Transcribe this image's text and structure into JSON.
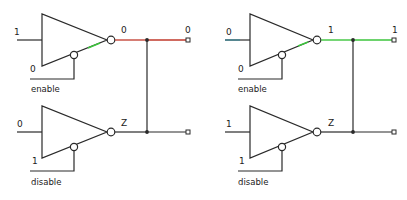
{
  "diagram": {
    "colors": {
      "logic_low": "#c0392b",
      "logic_high": "#3cc43c",
      "wire": "#2a2a2a",
      "background": "#ffffff"
    },
    "circuits": [
      {
        "name": "left",
        "top_gate": {
          "input": "1",
          "control_value": "0",
          "control_label": "enable",
          "output": "0"
        },
        "bottom_gate": {
          "input": "0",
          "control_value": "1",
          "control_label": "disable",
          "output": "Z"
        },
        "bus_output": "0"
      },
      {
        "name": "right",
        "top_gate": {
          "input": "0",
          "control_value": "0",
          "control_label": "enable",
          "output": "1"
        },
        "bottom_gate": {
          "input": "1",
          "control_value": "1",
          "control_label": "disable",
          "output": "Z"
        },
        "bus_output": "1"
      }
    ]
  }
}
